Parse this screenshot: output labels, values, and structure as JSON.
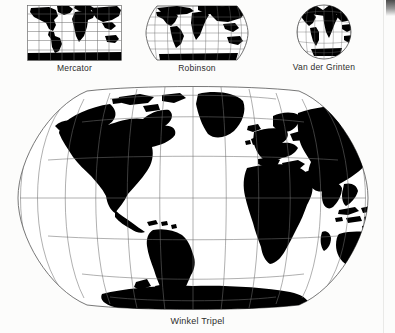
{
  "figure": {
    "kind": "map-projection-comparison-figure",
    "background_color": "#fcfcfb",
    "land_color": "#000000",
    "graticule_color": "#6b6b6b",
    "label_color": "#2c2c2c"
  },
  "thumbnails": [
    {
      "id": "mercator",
      "label": "Mercator",
      "shape": "rectangle",
      "meridian_count": 8,
      "parallel_count": 6,
      "box": {
        "x": 27,
        "y": 5,
        "w": 95,
        "h": 56
      }
    },
    {
      "id": "robinson",
      "label": "Robinson",
      "shape": "flat-topped-oval",
      "meridian_count": 9,
      "parallel_count": 5,
      "box": {
        "x": 142,
        "y": 4,
        "w": 110,
        "h": 58
      }
    },
    {
      "id": "van-der-grinten",
      "label": "Van der Grinten",
      "shape": "circle",
      "meridian_count": 9,
      "parallel_count": 7,
      "box": {
        "x": 288,
        "y": 3,
        "w": 72,
        "h": 58
      }
    }
  ],
  "main_map": {
    "id": "winkel-tripel",
    "label": "Winkel Tripel",
    "shape": "rounded-oval",
    "meridian_count": 13,
    "parallel_count": 7,
    "box": {
      "x": 12,
      "y": 84,
      "w": 362,
      "h": 228
    }
  },
  "artifacts": {
    "scan_edge_label": "page-scan-edge",
    "scan_blot_label": "scan-blot"
  }
}
